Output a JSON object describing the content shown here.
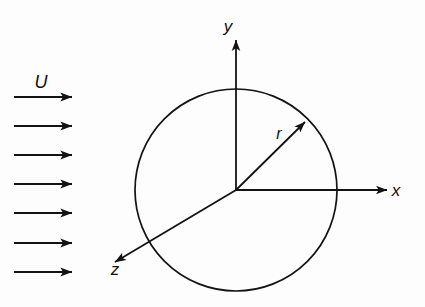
{
  "figure": {
    "kind": "technical-diagram",
    "background_color": "#fdfdfd",
    "line_color": "#131313"
  },
  "labels": {
    "freestream": "U",
    "radial": "r",
    "axis_x": "x",
    "axis_y": "y",
    "axis_z": "z"
  },
  "geometry": {
    "center": {
      "x": 236,
      "y": 190
    },
    "circle_radius": 101,
    "axis_x": {
      "x1": 236,
      "y1": 190,
      "x2": 387,
      "y2": 190
    },
    "axis_y": {
      "x1": 236,
      "y1": 190,
      "x2": 236,
      "y2": 40
    },
    "axis_z": {
      "x1": 236,
      "y1": 190,
      "x2": 115,
      "y2": 262
    },
    "radial_vector": {
      "x1": 236,
      "y1": 190,
      "x2": 305,
      "y2": 122
    },
    "radial_angle_deg": 45
  },
  "flow_arrows": {
    "count": 7,
    "x_start": 14,
    "x_end": 72,
    "y_positions": [
      97,
      126,
      155,
      184,
      213,
      243,
      272
    ]
  },
  "label_positions": {
    "freestream": {
      "x": 41,
      "y": 88
    },
    "radial": {
      "x": 279,
      "y": 139
    },
    "axis_x": {
      "x": 396,
      "y": 196
    },
    "axis_y": {
      "x": 228,
      "y": 32
    },
    "axis_z": {
      "x": 115,
      "y": 275
    }
  },
  "icons": {
    "flow_arrow": "right-arrow-icon",
    "axis_arrow": "axis-arrow-icon"
  }
}
